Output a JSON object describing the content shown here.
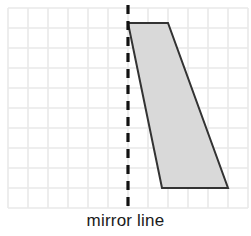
{
  "figure": {
    "kind": "geometry-reflection-worksheet",
    "width": 251,
    "height": 236,
    "background_color": "#ffffff",
    "caption": "mirror line"
  },
  "grid": {
    "name": "square-grid",
    "origin_x": 8,
    "origin_y": 8,
    "cell_size": 20,
    "columns": 12,
    "rows": 10,
    "line_color": "#e9e9e9",
    "line_width": 1.6,
    "right_edge_x": 248,
    "bottom_edge_y": 208
  },
  "mirror_line": {
    "name": "mirror-line",
    "orientation": "vertical",
    "x": 128,
    "y_start": 5,
    "y_end": 212,
    "color": "#111111",
    "stroke_width": 3.2,
    "dash_pattern": "9 7"
  },
  "shape": {
    "name": "shaded-quadrilateral",
    "type": "parallelogram",
    "fill_color": "#d9d9d9",
    "stroke_color": "#333333",
    "stroke_width": 2,
    "vertices": [
      {
        "label": "top-left",
        "x": 128,
        "y": 23
      },
      {
        "label": "top-right",
        "x": 168,
        "y": 23
      },
      {
        "label": "bottom-right",
        "x": 228,
        "y": 188
      },
      {
        "label": "bottom-left",
        "x": 162,
        "y": 188
      }
    ],
    "points_attr": "128,23 168,23 228,188 162,188"
  }
}
